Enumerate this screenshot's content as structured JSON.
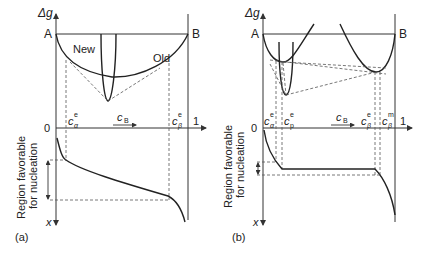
{
  "figure": {
    "panels": [
      {
        "id": "a",
        "caption": "(a)",
        "y_axis_label": "Δg",
        "lower_axis_label": "x",
        "left_label": "A",
        "right_label": "B",
        "origin_label": "0",
        "end_label": "1",
        "composition_label": "c",
        "composition_sub": "B",
        "curve_labels": [
          "New",
          "Old"
        ],
        "marks": [
          {
            "base": "c",
            "sup": "e",
            "sub": "α"
          },
          {
            "base": "c",
            "sup": "e",
            "sub": "β"
          }
        ],
        "region_label_line1": "Region favorable",
        "region_label_line2": "for nucleation"
      },
      {
        "id": "b",
        "caption": "(b)",
        "y_axis_label": "Δg",
        "lower_axis_label": "x",
        "left_label": "A",
        "right_label": "B",
        "origin_label": "0",
        "end_label": "1",
        "composition_label": "c",
        "composition_sub": "B",
        "marks": [
          {
            "base": "c",
            "sup": "e",
            "sub": "α"
          },
          {
            "base": "c",
            "sup": "e",
            "sub": "p"
          },
          {
            "base": "c",
            "sup": "e",
            "sub": "β"
          },
          {
            "base": "c",
            "sup": "m",
            "sub": "β"
          }
        ],
        "region_label_line1": "Region favorable",
        "region_label_line2": "for nucleation"
      }
    ]
  }
}
